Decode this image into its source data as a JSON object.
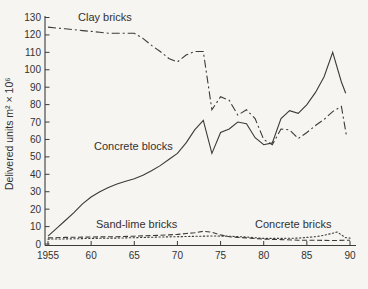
{
  "chart_data": {
    "type": "line",
    "title": "",
    "xlabel": "",
    "ylabel": "Delivered units m² × 10⁶",
    "xlim": [
      1955,
      1991
    ],
    "ylim": [
      0,
      130
    ],
    "grid": false,
    "legend_position": "inline-annotations",
    "y_ticks": [
      0,
      10,
      20,
      30,
      40,
      50,
      60,
      70,
      80,
      90,
      100,
      110,
      120,
      130
    ],
    "x_ticks": [
      {
        "value": 1955,
        "label": "1955"
      },
      {
        "value": 1960,
        "label": "60"
      },
      {
        "value": 1965,
        "label": "65"
      },
      {
        "value": 1970,
        "label": "70"
      },
      {
        "value": 1975,
        "label": "75"
      },
      {
        "value": 1980,
        "label": "80"
      },
      {
        "value": 1985,
        "label": "85"
      },
      {
        "value": 1990,
        "label": "90"
      }
    ],
    "series": [
      {
        "name": "Clay bricks",
        "style": "dashdot",
        "x": [
          1955,
          1956,
          1957,
          1958,
          1959,
          1960,
          1961,
          1962,
          1963,
          1964,
          1965,
          1966,
          1967,
          1968,
          1969,
          1970,
          1971,
          1972,
          1973,
          1974,
          1975,
          1976,
          1977,
          1978,
          1979,
          1980,
          1981,
          1982,
          1983,
          1984,
          1985,
          1986,
          1987,
          1988,
          1989,
          1989.6
        ],
        "y": [
          124.5,
          124,
          123.5,
          123,
          122.5,
          122,
          121.5,
          121,
          121,
          121,
          121,
          118,
          114,
          110.5,
          106.5,
          104.5,
          108.5,
          110.5,
          110.5,
          77,
          84.5,
          82.5,
          74,
          77,
          72,
          60,
          57,
          66,
          65.5,
          60.5,
          64,
          68,
          71.5,
          76,
          79,
          62
        ]
      },
      {
        "name": "Concrete blocks",
        "style": "solid",
        "x": [
          1955,
          1956,
          1957,
          1958,
          1959,
          1960,
          1961,
          1962,
          1963,
          1964,
          1965,
          1966,
          1967,
          1968,
          1969,
          1970,
          1971,
          1972,
          1973,
          1974,
          1975,
          1976,
          1977,
          1978,
          1979,
          1980,
          1981,
          1982,
          1983,
          1984,
          1985,
          1986,
          1987,
          1988,
          1989,
          1989.5
        ],
        "y": [
          4.5,
          9,
          13.5,
          18,
          23,
          27,
          30,
          32.5,
          34.5,
          36,
          37.5,
          39.5,
          42,
          45,
          48.5,
          52,
          58,
          65.5,
          71,
          52,
          64,
          66,
          70,
          69,
          61,
          57,
          58,
          72,
          76.5,
          75,
          80,
          87,
          96,
          110,
          93,
          86.5
        ]
      },
      {
        "name": "Sand-lime bricks",
        "style": "dashed",
        "x": [
          1955,
          1957,
          1960,
          1963,
          1965,
          1967,
          1969,
          1970,
          1971,
          1972,
          1973,
          1974,
          1975,
          1976,
          1977,
          1978,
          1980,
          1982,
          1984,
          1986,
          1988,
          1990
        ],
        "y": [
          3.5,
          3.8,
          4,
          4.2,
          4.5,
          4.8,
          5.2,
          5.5,
          6,
          6.5,
          7.3,
          6.8,
          5.2,
          4.2,
          3.8,
          3.5,
          2.8,
          2.5,
          2.2,
          2.1,
          2,
          2.2
        ]
      },
      {
        "name": "Concrete bricks",
        "style": "dotted",
        "x": [
          1955,
          1958,
          1960,
          1963,
          1965,
          1968,
          1970,
          1972,
          1974,
          1976,
          1978,
          1980,
          1982,
          1984,
          1985,
          1986,
          1987,
          1988,
          1988.5,
          1989.5,
          1990
        ],
        "y": [
          2.8,
          3,
          3.2,
          3.4,
          3.6,
          4,
          4.2,
          4.4,
          4.6,
          4.5,
          4,
          3.2,
          3.2,
          3.4,
          3.8,
          4.2,
          5,
          6.2,
          6.9,
          3.6,
          3.4
        ]
      }
    ],
    "annotations": [
      {
        "text": "Clay bricks",
        "x": 78,
        "y": 21
      },
      {
        "text": "Concrete blocks",
        "x": 94,
        "y": 150
      },
      {
        "text": "Sand-lime bricks",
        "x": 96,
        "y": 228
      },
      {
        "text": "Concrete bricks",
        "x": 255,
        "y": 228
      }
    ],
    "line_color": "#3b3b3b"
  }
}
